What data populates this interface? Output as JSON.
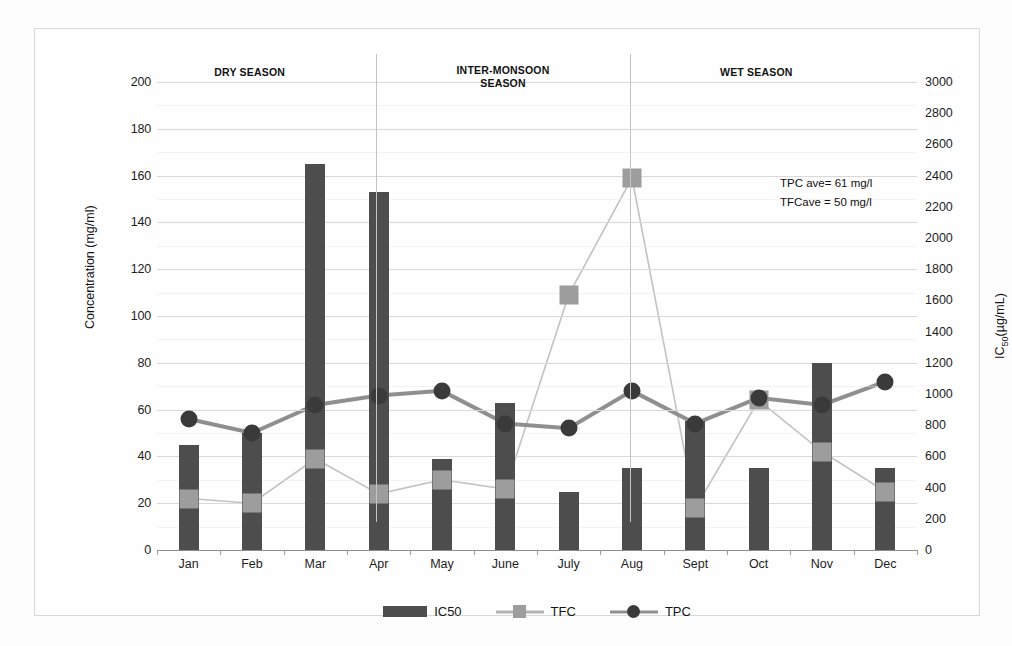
{
  "chart_data": {
    "type": "bar",
    "title": "",
    "xlabel": "",
    "ylabel": "Concentration (mg/ml)",
    "y2label": "IC50(µg/mL)",
    "ylim": [
      0,
      200
    ],
    "y2lim": [
      0,
      3000
    ],
    "grid": true,
    "legend_position": "bottom",
    "categories": [
      "Jan",
      "Feb",
      "Mar",
      "Apr",
      "May",
      "June",
      "July",
      "Aug",
      "Sept",
      "Oct",
      "Nov",
      "Dec"
    ],
    "series": [
      {
        "name": "IC50",
        "type": "bar",
        "axis": "right",
        "color": "#4d4d4d",
        "values_left_scale": [
          45,
          50,
          165,
          153,
          39,
          63,
          25,
          35,
          55,
          35,
          80,
          35
        ],
        "values": [
          675,
          750,
          2475,
          2295,
          585,
          945,
          375,
          525,
          825,
          525,
          1200,
          525
        ]
      },
      {
        "name": "TFC",
        "type": "line",
        "axis": "left",
        "color": "#9d9d9d",
        "values": [
          22,
          20,
          39,
          24,
          30,
          26,
          109,
          159,
          18,
          64,
          42,
          25
        ]
      },
      {
        "name": "TPC",
        "type": "line",
        "axis": "left",
        "color": "#3a3a3a",
        "values": [
          56,
          50,
          62,
          66,
          68,
          54,
          52,
          68,
          54,
          65,
          62,
          72
        ]
      }
    ],
    "y_ticks": [
      0,
      20,
      40,
      60,
      80,
      100,
      120,
      140,
      160,
      180,
      200
    ],
    "y2_ticks": [
      0,
      200,
      400,
      600,
      800,
      1000,
      1200,
      1400,
      1600,
      1800,
      2000,
      2200,
      2400,
      2600,
      2800,
      3000
    ],
    "annotations": [
      {
        "text": "TPC ave= 61 mg/l"
      },
      {
        "text": "TFCave = 50 mg/l"
      }
    ],
    "season_bands": [
      {
        "label": "DRY SEASON",
        "months": [
          "Jan",
          "Feb",
          "Mar",
          "Apr"
        ]
      },
      {
        "label": "INTER-MONSOON",
        "label2": "SEASON",
        "months": [
          "May",
          "June",
          "July",
          "Aug"
        ]
      },
      {
        "label": "WET SEASON",
        "months": [
          "Sept",
          "Oct",
          "Nov",
          "Dec"
        ]
      }
    ]
  },
  "legend": {
    "items": [
      {
        "label": "IC50"
      },
      {
        "label": "TFC"
      },
      {
        "label": "TPC"
      }
    ]
  }
}
